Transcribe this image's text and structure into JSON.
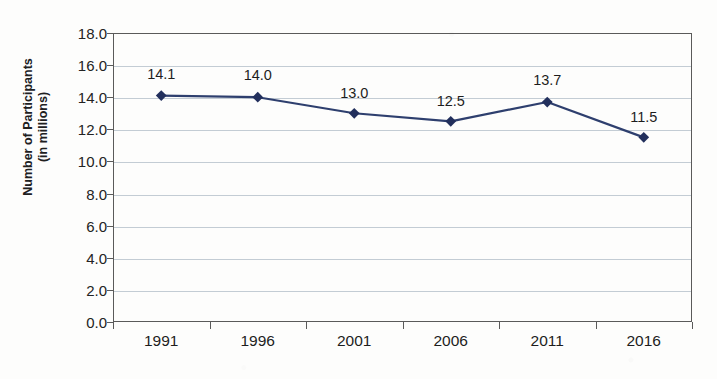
{
  "chart_data": {
    "type": "line",
    "title": "",
    "xlabel": "",
    "ylabel": "Number of Participants\n(in millions)",
    "ylabel_line1": "Number of Participants",
    "ylabel_line2": "(in millions)",
    "categories": [
      "1991",
      "1996",
      "2001",
      "2006",
      "2011",
      "2016"
    ],
    "values": [
      14.1,
      14.0,
      13.0,
      12.5,
      13.7,
      11.5
    ],
    "point_labels": [
      "14.1",
      "14.0",
      "13.0",
      "12.5",
      "13.7",
      "11.5"
    ],
    "ylim": [
      0.0,
      18.0
    ],
    "y_ticks": [
      "0.0",
      "2.0",
      "4.0",
      "6.0",
      "8.0",
      "10.0",
      "12.0",
      "14.0",
      "16.0",
      "18.0"
    ],
    "y_tick_values": [
      0.0,
      2.0,
      4.0,
      6.0,
      8.0,
      10.0,
      12.0,
      14.0,
      16.0,
      18.0
    ],
    "grid": true,
    "grid_axis": "y",
    "legend": false,
    "legend_position": "none",
    "series": [
      {
        "name": "Number of Participants",
        "values": [
          14.1,
          14.0,
          13.0,
          12.5,
          13.7,
          11.5
        ],
        "marker": "diamond",
        "color": "#2e3f6e"
      }
    ],
    "colors": {
      "line": "#2e3f6e",
      "marker": "#222f5c",
      "gridline": "#c3ccd4",
      "axis": "#5a5a5a",
      "text": "#1d1d1d",
      "background": "#fdfdfc"
    }
  }
}
